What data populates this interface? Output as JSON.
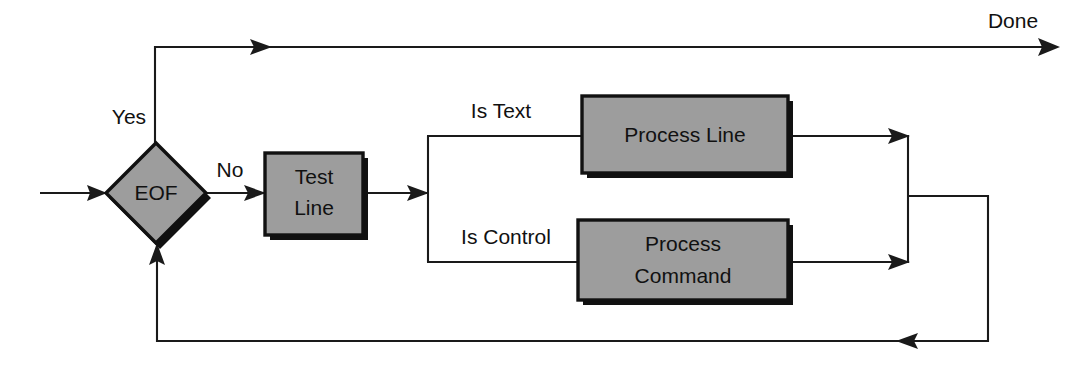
{
  "diagram": {
    "type": "flowchart",
    "title": "",
    "colors": {
      "node_fill": "#9d9d9d",
      "node_border": "#111111",
      "line": "#1a1a1a",
      "background": "#ffffff",
      "text": "#111111"
    },
    "nodes": [
      {
        "id": "eof",
        "shape": "diamond",
        "label": "EOF",
        "lines": [
          "EOF"
        ]
      },
      {
        "id": "test-line",
        "shape": "rectangle",
        "label": "Test Line",
        "lines": [
          "Test",
          "Line"
        ]
      },
      {
        "id": "process-line",
        "shape": "rectangle",
        "label": "Process Line",
        "lines": [
          "Process Line"
        ]
      },
      {
        "id": "process-command",
        "shape": "rectangle",
        "label": "Process Command",
        "lines": [
          "Process",
          "Command"
        ]
      }
    ],
    "edge_labels": {
      "yes": "Yes",
      "no": "No",
      "done": "Done",
      "is_text": "Is Text",
      "is_control": "Is Control"
    },
    "edges": [
      {
        "from": "start",
        "to": "eof",
        "label": ""
      },
      {
        "from": "eof",
        "to": "done",
        "label": "Yes"
      },
      {
        "from": "eof",
        "to": "test-line",
        "label": "No"
      },
      {
        "from": "test-line",
        "to": "process-line",
        "label": "Is Text"
      },
      {
        "from": "test-line",
        "to": "process-command",
        "label": "Is Control"
      },
      {
        "from": "process-line",
        "to": "eof",
        "label": ""
      },
      {
        "from": "process-command",
        "to": "eof",
        "label": ""
      }
    ]
  }
}
